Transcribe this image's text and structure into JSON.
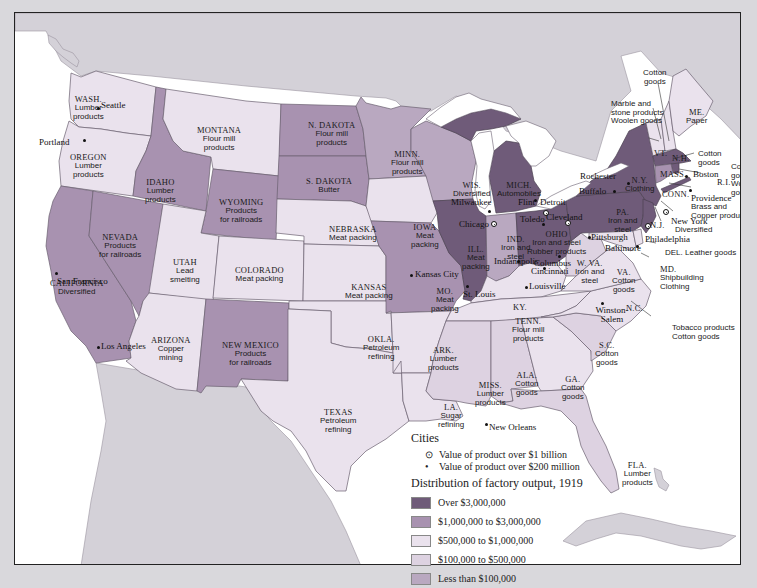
{
  "colors": {
    "over_3m": "#6f5b79",
    "1m_3m": "#a892b0",
    "500k_1m": "#eae2ed",
    "100k_500k": "#ddd2e1",
    "under_100k": "#b9a8c0",
    "foreign_land": "#d4d1d8",
    "water": "#ffffff",
    "page_bg": "#d9d8dc"
  },
  "states": [
    {
      "abbr": "WASH.",
      "product": "Lumber products",
      "category": "500k_1m"
    },
    {
      "abbr": "OREGON",
      "product": "Lumber products",
      "category": "500k_1m"
    },
    {
      "abbr": "CALIFORNIA",
      "product": "Diversified",
      "category": "1m_3m"
    },
    {
      "abbr": "IDAHO",
      "product": "Lumber products",
      "category": "1m_3m"
    },
    {
      "abbr": "NEVADA",
      "product": "Products for railroads",
      "category": "1m_3m"
    },
    {
      "abbr": "MONTANA",
      "product": "Flour mill products",
      "category": "500k_1m"
    },
    {
      "abbr": "WYOMING",
      "product": "Products for railroads",
      "category": "1m_3m"
    },
    {
      "abbr": "UTAH",
      "product": "Lead smelting",
      "category": "500k_1m"
    },
    {
      "abbr": "COLORADO",
      "product": "Meat packing",
      "category": "500k_1m"
    },
    {
      "abbr": "ARIZONA",
      "product": "Copper mining",
      "category": "500k_1m"
    },
    {
      "abbr": "NEW MEXICO",
      "product": "Products for railroads",
      "category": "1m_3m"
    },
    {
      "abbr": "N. DAKOTA",
      "product": "Flour mill products",
      "category": "1m_3m"
    },
    {
      "abbr": "S. DAKOTA",
      "product": "Butter",
      "category": "1m_3m"
    },
    {
      "abbr": "NEBRASKA",
      "product": "Meat packing",
      "category": "500k_1m"
    },
    {
      "abbr": "KANSAS",
      "product": "Meat packing",
      "category": "500k_1m"
    },
    {
      "abbr": "OKLA.",
      "product": "Petroleum refining",
      "category": "500k_1m"
    },
    {
      "abbr": "TEXAS",
      "product": "Petroleum refining",
      "category": "500k_1m"
    },
    {
      "abbr": "MINN.",
      "product": "Flour mill products",
      "category": "under_100k"
    },
    {
      "abbr": "IOWA",
      "product": "Meat packing",
      "category": "500k_1m"
    },
    {
      "abbr": "MO.",
      "product": "Meat packing",
      "category": "1m_3m"
    },
    {
      "abbr": "ARK.",
      "product": "Lumber products",
      "category": "500k_1m"
    },
    {
      "abbr": "LA.",
      "product": "Sugar refining",
      "category": "500k_1m"
    },
    {
      "abbr": "WIS.",
      "product": "Diversified",
      "category": "under_100k"
    },
    {
      "abbr": "ILL.",
      "product": "Meat packing",
      "category": "over_3m"
    },
    {
      "abbr": "MICH.",
      "product": "Automobiles",
      "category": "over_3m"
    },
    {
      "abbr": "IND.",
      "product": "Iron and steel",
      "category": "under_100k"
    },
    {
      "abbr": "OHIO",
      "product": "Iron and steel Rubber products",
      "category": "over_3m"
    },
    {
      "abbr": "KY.",
      "product": "",
      "category": "500k_1m"
    },
    {
      "abbr": "TENN.",
      "product": "Flour mill products",
      "category": "500k_1m"
    },
    {
      "abbr": "MISS.",
      "product": "Lumber products",
      "category": "100k_500k"
    },
    {
      "abbr": "ALA.",
      "product": "Cotton goods",
      "category": "100k_500k"
    },
    {
      "abbr": "GA.",
      "product": "Cotton goods",
      "category": "500k_1m"
    },
    {
      "abbr": "FLA.",
      "product": "Lumber products",
      "category": "100k_500k"
    },
    {
      "abbr": "S.C.",
      "product": "Cotton goods",
      "category": "100k_500k"
    },
    {
      "abbr": "N.C.",
      "product": "Tobacco products Cotton goods",
      "category": "500k_1m"
    },
    {
      "abbr": "VA.",
      "product": "Cotton goods",
      "category": "500k_1m"
    },
    {
      "abbr": "W. VA.",
      "product": "Iron and steel",
      "category": "100k_500k"
    },
    {
      "abbr": "PA.",
      "product": "Iron and steel",
      "category": "over_3m"
    },
    {
      "abbr": "N.Y.",
      "product": "Clothing",
      "category": "over_3m"
    },
    {
      "abbr": "N.J.",
      "product": "Diversified",
      "category": "over_3m"
    },
    {
      "abbr": "DEL.",
      "product": "Leather goods",
      "category": "500k_1m"
    },
    {
      "abbr": "MD.",
      "product": "Shipbuilding Clothing",
      "category": "500k_1m"
    },
    {
      "abbr": "VT.",
      "product": "Marble and stone products Woolen goods",
      "category": "500k_1m"
    },
    {
      "abbr": "N.H.",
      "product": "Cotton goods",
      "category": "500k_1m"
    },
    {
      "abbr": "ME.",
      "product": "Paper",
      "category": "500k_1m"
    },
    {
      "abbr": "MASS.",
      "product": "Cotton goods",
      "category": "over_3m"
    },
    {
      "abbr": "R.I.",
      "product": "Cotton goods Woolen goods",
      "category": "over_3m"
    },
    {
      "abbr": "CONN.",
      "product": "Brass and Copper products",
      "category": "1m_3m"
    }
  ],
  "labels": {
    "wash": {
      "st": "WASH.",
      "pr1": "Lumber",
      "pr2": "products"
    },
    "oregon": {
      "st": "OREGON",
      "pr1": "Lumber",
      "pr2": "products"
    },
    "idaho": {
      "st": "IDAHO",
      "pr1": "Lumber",
      "pr2": "products"
    },
    "montana": {
      "st": "MONTANA",
      "pr1": "Flour mill",
      "pr2": "products"
    },
    "wyoming": {
      "st": "WYOMING",
      "pr1": "Products",
      "pr2": "for railroads"
    },
    "nevada": {
      "st": "NEVADA",
      "pr1": "Products",
      "pr2": "for railroads"
    },
    "california": {
      "st": "CALIFORNIA",
      "pr1": "Diversified"
    },
    "utah": {
      "st": "UTAH",
      "pr1": "Lead",
      "pr2": "smelting"
    },
    "colorado": {
      "st": "COLORADO",
      "pr1": "Meat packing"
    },
    "arizona": {
      "st": "ARIZONA",
      "pr1": "Copper",
      "pr2": "mining"
    },
    "newmexico": {
      "st": "NEW MEXICO",
      "pr1": "Products",
      "pr2": "for railroads"
    },
    "ndakota": {
      "st": "N. DAKOTA",
      "pr1": "Flour mill",
      "pr2": "products"
    },
    "sdakota": {
      "st": "S. DAKOTA",
      "pr1": "Butter"
    },
    "nebraska": {
      "st": "NEBRASKA",
      "pr1": "Meat packing"
    },
    "kansas": {
      "st": "KANSAS",
      "pr1": "Meat packing"
    },
    "okla": {
      "st": "OKLA.",
      "pr1": "Petroleum",
      "pr2": "refining"
    },
    "texas": {
      "st": "TEXAS",
      "pr1": "Petroleum",
      "pr2": "refining"
    },
    "minn": {
      "st": "MINN.",
      "pr1": "Flour mill",
      "pr2": "products"
    },
    "iowa": {
      "st": "IOWA",
      "pr1": "Meat",
      "pr2": "packing"
    },
    "mo": {
      "st": "MO.",
      "pr1": "Meat",
      "pr2": "packing"
    },
    "ark": {
      "st": "ARK.",
      "pr1": "Lumber",
      "pr2": "products"
    },
    "la": {
      "st": "LA.",
      "pr1": "Sugar",
      "pr2": "refining"
    },
    "wis": {
      "st": "WIS.",
      "pr1": "Diversified"
    },
    "ill": {
      "st": "ILL.",
      "pr1": "Meat",
      "pr2": "packing"
    },
    "mich": {
      "st": "MICH.",
      "pr1": "Automobiles"
    },
    "ind": {
      "st": "IND.",
      "pr1": "Iron and",
      "pr2": "steel"
    },
    "ohio": {
      "st": "OHIO",
      "pr1": "Iron and steel",
      "pr2": "Rubber products"
    },
    "ky": {
      "st": "KY."
    },
    "tenn": {
      "st": "TENN.",
      "pr1": "Flour mill",
      "pr2": "products"
    },
    "miss": {
      "st": "MISS.",
      "pr1": "Lumber",
      "pr2": "products"
    },
    "ala": {
      "st": "ALA.",
      "pr1": "Cotton",
      "pr2": "goods"
    },
    "ga": {
      "st": "GA.",
      "pr1": "Cotton",
      "pr2": "goods"
    },
    "fla": {
      "st": "FLA.",
      "pr1": "Lumber",
      "pr2": "products"
    },
    "sc": {
      "st": "S.C.",
      "pr1": "Cotton",
      "pr2": "goods"
    },
    "nc": {
      "st": "N.C."
    },
    "nc_callout": {
      "pr1": "Tobacco products",
      "pr2": "Cotton goods"
    },
    "va": {
      "st": "VA.",
      "pr1": "Cotton",
      "pr2": "goods"
    },
    "wva": {
      "st": "W. VA.",
      "pr1": "Iron and",
      "pr2": "steel"
    },
    "pa": {
      "st": "PA.",
      "pr1": "Iron and",
      "pr2": "steel"
    },
    "ny": {
      "st": "N.Y.",
      "pr1": "Clothing"
    },
    "nj": {
      "st": "N.J."
    },
    "nj_callout": {
      "pr1": "Diversified"
    },
    "del_callout": {
      "text": "DEL. Leather goods"
    },
    "md_callout": {
      "st": "MD.",
      "pr1": "Shipbuilding",
      "pr2": "Clothing"
    },
    "vt": {
      "st": "VT."
    },
    "vt_callout": {
      "pr1": "Marble and",
      "pr2": "stone products",
      "pr3": "Woolen goods"
    },
    "nh": {
      "st": "N.H."
    },
    "nh_callout": {
      "pr1": "Cotton",
      "pr2": "goods"
    },
    "me": {
      "st": "ME.",
      "pr1": "Paper"
    },
    "mass": {
      "st": "MASS."
    },
    "mass_callout": {
      "pr1": "Cotton",
      "pr2": "goods"
    },
    "ri": {
      "st": "R.I."
    },
    "ri_callout": {
      "pr1": "Cotton",
      "pr2": "goods",
      "pr3": "Woolen",
      "pr4": "goods"
    },
    "conn": {
      "st": "CONN."
    },
    "conn_callout": {
      "pr1": "Brass and",
      "pr2": "Copper products"
    }
  },
  "cities": [
    {
      "name": "Seattle",
      "size": "small"
    },
    {
      "name": "Portland",
      "size": "small"
    },
    {
      "name": "San Francisco",
      "size": "small"
    },
    {
      "name": "Los Angeles",
      "size": "small"
    },
    {
      "name": "Kansas City",
      "size": "small"
    },
    {
      "name": "St. Louis",
      "size": "small"
    },
    {
      "name": "Milwaukee",
      "size": "small"
    },
    {
      "name": "Chicago",
      "size": "large"
    },
    {
      "name": "Flint",
      "size": "small"
    },
    {
      "name": "Detroit",
      "size": "large"
    },
    {
      "name": "Toledo",
      "size": "small"
    },
    {
      "name": "Cleveland",
      "size": "large"
    },
    {
      "name": "Indianapolis",
      "size": "small"
    },
    {
      "name": "Columbus",
      "size": "small"
    },
    {
      "name": "Cincinnati",
      "size": "small"
    },
    {
      "name": "Louisville",
      "size": "small"
    },
    {
      "name": "Pittsburgh",
      "size": "small"
    },
    {
      "name": "Buffalo",
      "size": "small"
    },
    {
      "name": "Rochester",
      "size": "small"
    },
    {
      "name": "Boston",
      "size": "small"
    },
    {
      "name": "Providence",
      "size": "small"
    },
    {
      "name": "New York",
      "size": "large"
    },
    {
      "name": "Philadelphia",
      "size": "large"
    },
    {
      "name": "Baltimore",
      "size": "small"
    },
    {
      "name": "Winston-Salem",
      "size": "small"
    },
    {
      "name": "New Orleans",
      "size": "small"
    }
  ],
  "legend": {
    "cities_title": "Cities",
    "city_large": "Value of product over $1 billion",
    "city_small": "Value of product over $200 million",
    "dist_title": "Distribution of factory output, 1919",
    "items": [
      {
        "label": "Over $3,000,000",
        "color": "#6f5b79"
      },
      {
        "label": "$1,000,000 to $3,000,000",
        "color": "#a892b0"
      },
      {
        "label": "$500,000 to $1,000,000",
        "color": "#eae2ed"
      },
      {
        "label": "$100,000 to $500,000",
        "color": "#ddd2e1"
      },
      {
        "label": "Less than $100,000",
        "color": "#b9a8c0"
      }
    ]
  }
}
